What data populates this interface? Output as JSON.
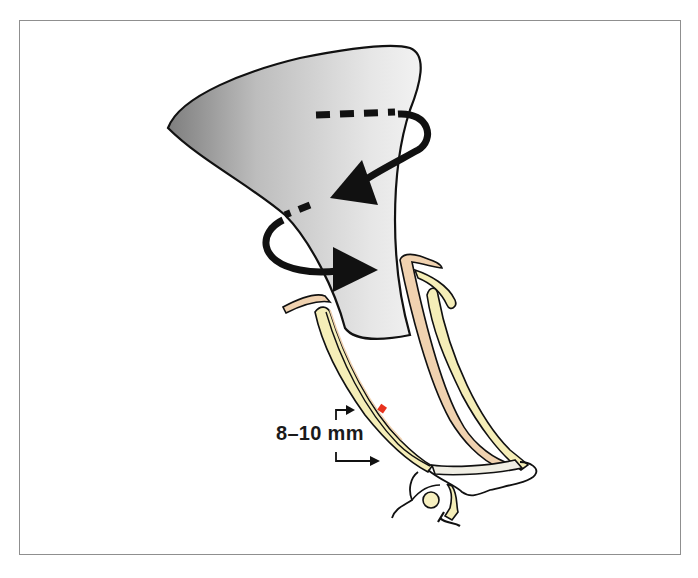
{
  "figure": {
    "measurement_label": "8–10 mm",
    "colors": {
      "frame_border": "#8f8f8f",
      "instrument_fill_light": "#ededed",
      "instrument_fill_dark": "#8a8a8a",
      "outline": "#111111",
      "canal_yellow": "#f5eeb8",
      "ligament_tan": "#f0d2b0",
      "marker_red": "#e8321e",
      "arrow_black": "#111111"
    },
    "elements": [
      "speculum-shaped instrument (grey funnel)",
      "rotation arrow (dashed, clockwise top loop)",
      "rotation arrow (dashed, lower loop)",
      "ear canal walls (yellow)",
      "tympanic region at bottom",
      "red marker on canal wall",
      "dimension arrows"
    ]
  }
}
